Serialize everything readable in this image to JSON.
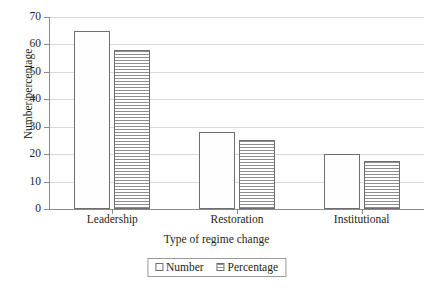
{
  "chart_data": {
    "type": "bar",
    "title": "",
    "categories": [
      "Leadership",
      "Restoration",
      "Institutional"
    ],
    "series": [
      {
        "name": "Number",
        "values": [
          65,
          28,
          20
        ],
        "pattern": "dotted"
      },
      {
        "name": "Percentage",
        "values": [
          58,
          25,
          17.5
        ],
        "pattern": "horizontal-lines"
      }
    ],
    "xlabel": "Type of regime change",
    "ylabel": "Number/percentage",
    "ylim": [
      0,
      70
    ],
    "ytick_values": [
      0,
      10,
      20,
      30,
      40,
      50,
      60,
      70
    ],
    "ytick_labels": [
      "0",
      "10",
      "20",
      "30",
      "40",
      "50",
      "60",
      "70"
    ],
    "grid": true,
    "grid_axis": "y",
    "legend_position": "bottom-center",
    "legend_boxed": true,
    "colors": {
      "bar_outline": "#6e6e6e",
      "gridline": "#d9d9d9",
      "axis": "#8c8c8c",
      "text": "#231f20",
      "background": "#ffffff"
    }
  }
}
